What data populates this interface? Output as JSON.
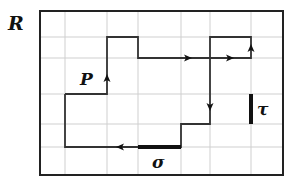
{
  "labels": {
    "region": "R",
    "path": "P",
    "sigma": "σ",
    "tau": "τ"
  },
  "colors": {
    "grid": "#cfcfcf",
    "border": "#222222",
    "path": "#333333",
    "highlight": "#111111"
  },
  "grid": {
    "x_lines": [
      40,
      65,
      107,
      138,
      181,
      210,
      251,
      283
    ],
    "y_lines": [
      11,
      37,
      58,
      94,
      124,
      147,
      175
    ]
  },
  "path_points": [
    [
      65,
      94
    ],
    [
      107,
      94
    ],
    [
      107,
      37
    ],
    [
      138,
      37
    ],
    [
      138,
      58
    ],
    [
      251,
      58
    ],
    [
      251,
      37
    ],
    [
      210,
      37
    ],
    [
      210,
      124
    ],
    [
      181,
      124
    ],
    [
      181,
      147
    ],
    [
      65,
      147
    ],
    [
      65,
      94
    ]
  ],
  "arrows": [
    {
      "x": 107,
      "y": 78,
      "dir": "up"
    },
    {
      "x": 188,
      "y": 58,
      "dir": "right"
    },
    {
      "x": 230,
      "y": 58,
      "dir": "right"
    },
    {
      "x": 251,
      "y": 48,
      "dir": "up"
    },
    {
      "x": 210,
      "y": 107,
      "dir": "down"
    },
    {
      "x": 120,
      "y": 147,
      "dir": "left"
    }
  ],
  "segments": {
    "sigma": {
      "x1": 138,
      "y1": 147,
      "x2": 181,
      "y2": 147
    },
    "tau": {
      "x1": 251,
      "y1": 94,
      "x2": 251,
      "y2": 124
    }
  }
}
